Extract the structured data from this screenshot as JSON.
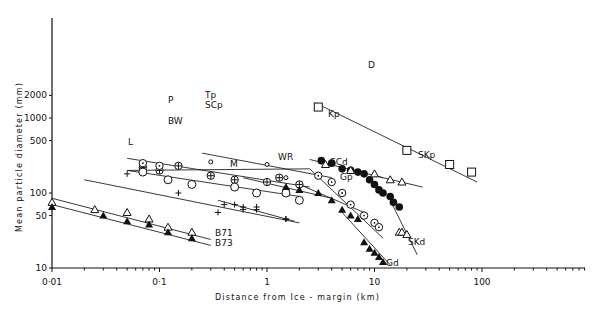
{
  "chart_data": {
    "type": "scatter",
    "title": "",
    "xlabel": "Distance from ice-margin (km)",
    "ylabel": "Mean particle diameter (mm)",
    "xscale": "log",
    "yscale": "log",
    "xlim": [
      0.01,
      700
    ],
    "ylim": [
      10,
      2000
    ],
    "x_ticks": [
      "0·01",
      "0·1",
      "1",
      "10",
      "100"
    ],
    "y_ticks": [
      "10",
      "50",
      "100",
      "500",
      "1000",
      "2000"
    ],
    "grid": false,
    "legend": "inline labels",
    "series": [
      {
        "name": "D",
        "marker": "open-square",
        "points": [
          [
            3,
            1400
          ],
          [
            20,
            370
          ],
          [
            50,
            240
          ],
          [
            80,
            190
          ]
        ],
        "trend": [
          [
            2.8,
            1600
          ],
          [
            90,
            140
          ]
        ]
      },
      {
        "name": "Kp",
        "marker": "filled-circle",
        "points": [
          [
            3.2,
            270
          ],
          [
            4,
            250
          ],
          [
            5,
            210
          ],
          [
            6,
            200
          ],
          [
            7,
            190
          ],
          [
            8,
            180
          ],
          [
            9,
            150
          ],
          [
            10,
            130
          ],
          [
            11,
            110
          ],
          [
            12,
            100
          ],
          [
            14,
            90
          ],
          [
            15,
            75
          ],
          [
            17,
            65
          ]
        ],
        "trend": [
          [
            2.5,
            280
          ],
          [
            12,
            160
          ]
        ]
      },
      {
        "name": "SKp",
        "marker": "open-triangle",
        "points": [
          [
            3.5,
            240
          ],
          [
            6,
            200
          ],
          [
            10,
            180
          ],
          [
            14,
            150
          ],
          [
            18,
            140
          ]
        ],
        "trend": [
          [
            10,
            170
          ],
          [
            28,
            120
          ]
        ]
      },
      {
        "name": "SKd",
        "marker": "open-triangle",
        "points": [
          [
            17,
            30
          ],
          [
            18,
            30
          ],
          [
            20,
            28
          ]
        ],
        "trend": [
          [
            14,
            80
          ],
          [
            25,
            15
          ]
        ]
      },
      {
        "name": "SCp",
        "marker": "circle-plus",
        "points": [
          [
            0.07,
            220
          ],
          [
            0.1,
            200
          ],
          [
            0.15,
            230
          ],
          [
            0.3,
            170
          ],
          [
            0.5,
            150
          ],
          [
            1,
            140
          ],
          [
            1.3,
            160
          ],
          [
            2,
            130
          ]
        ],
        "trend": [
          [
            0.05,
            200
          ],
          [
            2.5,
            210
          ]
        ]
      },
      {
        "name": "SCd",
        "marker": "circle-dot",
        "points": [
          [
            3,
            170
          ],
          [
            4,
            140
          ],
          [
            5,
            100
          ],
          [
            6,
            70
          ],
          [
            8,
            50
          ],
          [
            10,
            40
          ],
          [
            11,
            35
          ]
        ],
        "trend": [
          [
            2.5,
            210
          ],
          [
            12,
            25
          ]
        ]
      },
      {
        "name": "Tp",
        "marker": "small-open-circle",
        "points": [
          [
            0.3,
            260
          ],
          [
            1,
            240
          ],
          [
            1.5,
            160
          ]
        ],
        "trend": [
          [
            0.25,
            340
          ],
          [
            4,
            160
          ]
        ]
      },
      {
        "name": "P",
        "marker": "circle-dot",
        "points": [
          [
            0.07,
            250
          ],
          [
            0.1,
            230
          ]
        ],
        "trend": [
          [
            0.05,
            290
          ],
          [
            2.5,
            120
          ]
        ]
      },
      {
        "name": "BW",
        "marker": "open-circle",
        "points": [
          [
            0.07,
            190
          ],
          [
            0.12,
            150
          ],
          [
            0.2,
            130
          ],
          [
            0.5,
            120
          ],
          [
            0.8,
            100
          ],
          [
            1.5,
            100
          ],
          [
            2,
            80
          ]
        ],
        "trend": [
          [
            0.05,
            200
          ],
          [
            2,
            90
          ]
        ]
      },
      {
        "name": "WR",
        "marker": "filled-triangle",
        "points": [
          [
            1.5,
            120
          ],
          [
            2,
            110
          ],
          [
            3,
            100
          ]
        ],
        "trend": [
          [
            0.6,
            160
          ],
          [
            4,
            85
          ]
        ]
      },
      {
        "name": "Gp",
        "marker": "filled-triangle",
        "points": [
          [
            4,
            80
          ],
          [
            5,
            60
          ],
          [
            6,
            50
          ],
          [
            7,
            45
          ]
        ],
        "trend": [
          [
            2,
            130
          ],
          [
            8,
            55
          ]
        ]
      },
      {
        "name": "Gd",
        "marker": "filled-triangle",
        "points": [
          [
            8,
            22
          ],
          [
            9,
            18
          ],
          [
            10,
            16
          ],
          [
            11,
            14
          ],
          [
            12,
            12
          ]
        ],
        "trend": [
          [
            5,
            55
          ],
          [
            14,
            11
          ]
        ]
      },
      {
        "name": "L",
        "marker": "plus",
        "points": [
          [
            0.05,
            180
          ],
          [
            0.15,
            100
          ],
          [
            0.35,
            55
          ],
          [
            0.5,
            70
          ],
          [
            0.6,
            60
          ],
          [
            0.8,
            65
          ],
          [
            1.5,
            45
          ]
        ],
        "trend": [
          [
            0.02,
            150
          ],
          [
            2,
            40
          ]
        ]
      },
      {
        "name": "M",
        "marker": "plus",
        "points": [
          [
            0.4,
            70
          ],
          [
            0.6,
            65
          ],
          [
            0.8,
            60
          ],
          [
            1.5,
            45
          ]
        ],
        "trend": [
          [
            0.35,
            80
          ],
          [
            1.8,
            42
          ]
        ]
      },
      {
        "name": "B71",
        "marker": "open-triangle",
        "points": [
          [
            0.01,
            75
          ],
          [
            0.025,
            60
          ],
          [
            0.05,
            55
          ],
          [
            0.08,
            45
          ],
          [
            0.12,
            35
          ],
          [
            0.2,
            30
          ]
        ],
        "trend": [
          [
            0.01,
            85
          ],
          [
            0.3,
            24
          ]
        ]
      },
      {
        "name": "B73",
        "marker": "filled-triangle",
        "points": [
          [
            0.01,
            65
          ],
          [
            0.03,
            50
          ],
          [
            0.05,
            42
          ],
          [
            0.08,
            38
          ],
          [
            0.12,
            30
          ],
          [
            0.2,
            25
          ]
        ],
        "trend": [
          [
            0.01,
            70
          ],
          [
            0.3,
            20
          ]
        ]
      }
    ]
  },
  "axes": {
    "xlabel": "Distance  from  Ice - margin  (km)",
    "ylabel": "Mean  particle  diameter  (mm)"
  }
}
